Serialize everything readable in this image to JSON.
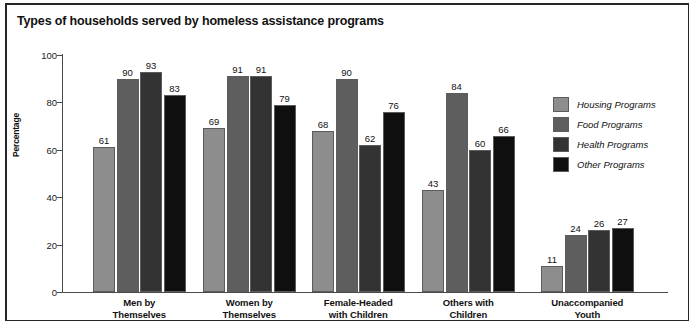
{
  "chart_data": {
    "type": "bar",
    "title": "Types of households served by homeless assistance programs",
    "xlabel": "",
    "ylabel": "Percentage",
    "ylim": [
      0,
      100
    ],
    "yticks": [
      0,
      20,
      40,
      60,
      80,
      100
    ],
    "grid": false,
    "legend_position": "right",
    "categories": [
      "Men by\nThemselves",
      "Women by\nThemselves",
      "Female-Headed\nwith Children",
      "Others with\nChildren",
      "Unaccompanied\nYouth"
    ],
    "category_lines": [
      [
        "Men by",
        "Themselves"
      ],
      [
        "Women by",
        "Themselves"
      ],
      [
        "Female-Headed",
        "with Children"
      ],
      [
        "Others with",
        "Children"
      ],
      [
        "Unaccompanied",
        "Youth"
      ]
    ],
    "series": [
      {
        "name": "Housing Programs",
        "color": "#8d8d8d",
        "values": [
          61,
          69,
          68,
          43,
          11
        ]
      },
      {
        "name": "Food Programs",
        "color": "#5e5e5e",
        "values": [
          90,
          91,
          90,
          84,
          24
        ]
      },
      {
        "name": "Health Programs",
        "color": "#333333",
        "values": [
          93,
          91,
          62,
          60,
          26
        ]
      },
      {
        "name": "Other Programs",
        "color": "#0f0f0f",
        "values": [
          83,
          79,
          76,
          66,
          27
        ]
      }
    ]
  },
  "legend": {
    "items": [
      {
        "label": "Housing Programs"
      },
      {
        "label": "Food Programs"
      },
      {
        "label": "Health Programs"
      },
      {
        "label": "Other Programs"
      }
    ]
  }
}
